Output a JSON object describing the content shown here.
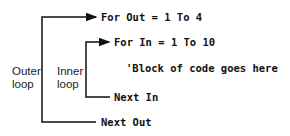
{
  "diagram": {
    "code_lines": {
      "for_out": "For Out = 1 To 4",
      "for_in": "For In = 1 To 10",
      "comment": "'Block of code goes here",
      "next_in": "Next In",
      "next_out": "Next Out"
    },
    "labels": {
      "outer_line1": "Outer",
      "outer_line2": "loop",
      "inner_line1": "Inner",
      "inner_line2": "loop"
    },
    "colors": {
      "line": "#111111",
      "text": "#111111"
    }
  }
}
